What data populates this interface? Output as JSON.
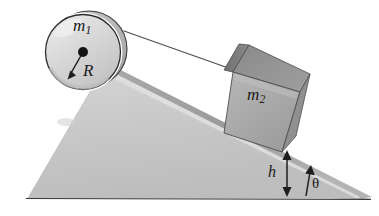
{
  "figure": {
    "kind": "physics-diagram",
    "background_color": "#ffffff"
  },
  "labels": {
    "pulley_mass": "m",
    "pulley_mass_sub": "1",
    "radius": "R",
    "block_mass": "m",
    "block_mass_sub": "2",
    "height": "h",
    "angle": "θ"
  },
  "colors": {
    "incline_front": "#c9c9c9",
    "incline_top_band": "#9d9d9d",
    "incline_highlight": "#e4e4e4",
    "block_front": "#a9a9a9",
    "block_top": "#8d8d8d",
    "block_side": "#777777",
    "cylinder_face": "#d4d4d4",
    "cylinder_rim": "#b0b0b0",
    "outline": "#2b2b2b",
    "cord": "#555555",
    "label_text": "#1a1a1a"
  },
  "geometry": {
    "baseline_y": 198,
    "apex_x": 105,
    "apex_y": 68,
    "ramp_tip_x": 360,
    "ramp_tip_y": 198,
    "base_left_x": 28,
    "cylinder_center_x": 83,
    "cylinder_center_y": 52,
    "cylinder_radius": 38,
    "height_marker_x": 287,
    "height_top_y": 152,
    "height_bottom_y": 196,
    "incline_angle_deg": 23
  },
  "elements": {
    "cylinder_name": "cylinder-m1",
    "block_name": "block-m2",
    "incline_name": "inclined-wedge",
    "cord_name": "connecting-cord",
    "height_arrow_name": "height-dimension-arrow",
    "angle_arrow_name": "angle-indicator-arrow",
    "center_dot_name": "cylinder-center-dot",
    "radius_arrow_name": "radius-arrow"
  }
}
